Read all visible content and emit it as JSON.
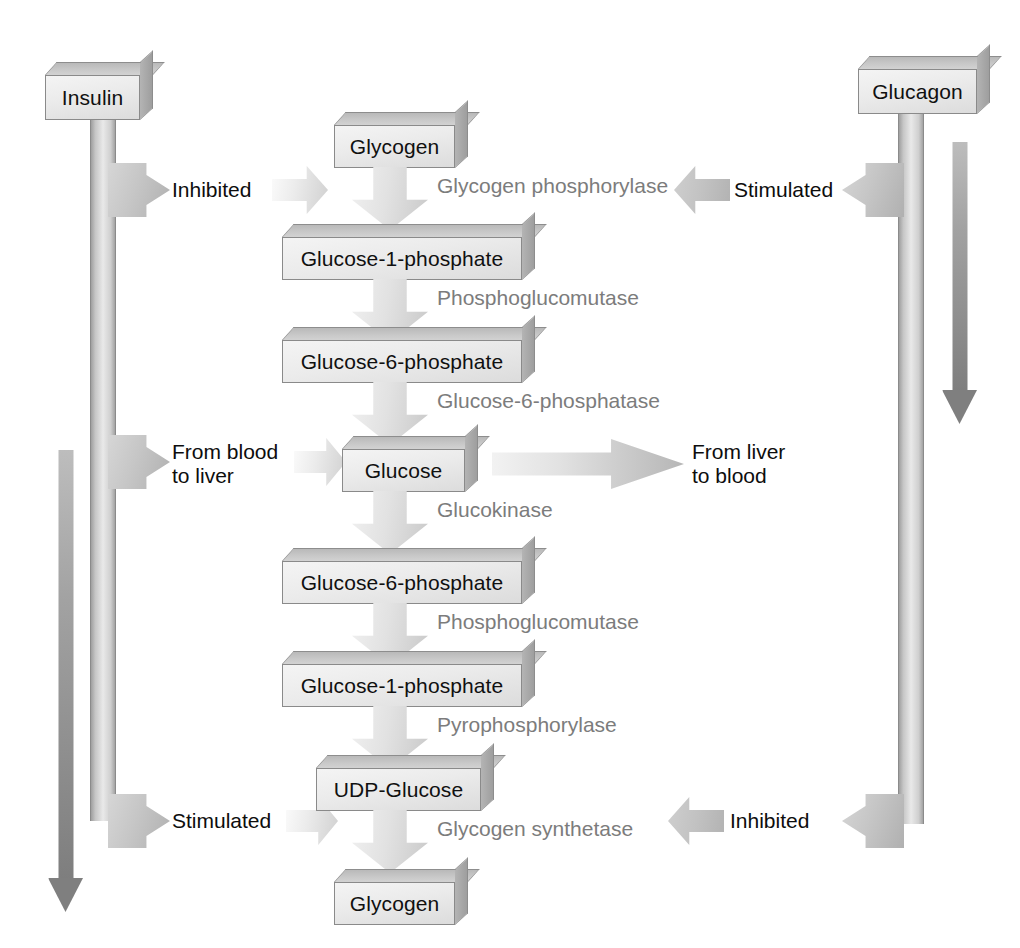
{
  "diagram": {
    "type": "flow-diagram",
    "colors": {
      "metabolite_text": "#0d0d0d",
      "enzyme_text": "#7c7c7c",
      "box_face": "#ececec",
      "box_edge": "#8a8a8a",
      "arrow_fill": "#c6c6c6",
      "background": "#ffffff"
    }
  },
  "hormones": {
    "left": {
      "label": "Insulin",
      "effects": [
        {
          "label": "Inhibited",
          "target": "Glycogen phosphorylase"
        },
        {
          "label": "From blood\nto liver",
          "target": "Glucose"
        },
        {
          "label": "Stimulated",
          "target": "Glycogen synthetase"
        }
      ]
    },
    "right": {
      "label": "Glucagon",
      "effects": [
        {
          "label": "Stimulated",
          "target": "Glycogen phosphorylase"
        },
        {
          "label": "Inhibited",
          "target": "Glycogen synthetase"
        }
      ]
    }
  },
  "transport": {
    "into_liver": "From blood\nto liver",
    "out_of_liver": "From liver\nto blood"
  },
  "metabolites": [
    {
      "id": "m0",
      "label": "Glycogen"
    },
    {
      "id": "m1",
      "label": "Glucose-1-phosphate"
    },
    {
      "id": "m2",
      "label": "Glucose-6-phosphate"
    },
    {
      "id": "m3",
      "label": "Glucose"
    },
    {
      "id": "m4",
      "label": "Glucose-6-phosphate"
    },
    {
      "id": "m5",
      "label": "Glucose-1-phosphate"
    },
    {
      "id": "m6",
      "label": "UDP-Glucose"
    },
    {
      "id": "m7",
      "label": "Glycogen"
    }
  ],
  "enzymes": [
    {
      "id": "e0",
      "label": "Glycogen phosphorylase",
      "from": "m0",
      "to": "m1"
    },
    {
      "id": "e1",
      "label": "Phosphoglucomutase",
      "from": "m1",
      "to": "m2"
    },
    {
      "id": "e2",
      "label": "Glucose-6-phosphatase",
      "from": "m2",
      "to": "m3"
    },
    {
      "id": "e3",
      "label": "Glucokinase",
      "from": "m3",
      "to": "m4"
    },
    {
      "id": "e4",
      "label": "Phosphoglucomutase",
      "from": "m4",
      "to": "m5"
    },
    {
      "id": "e5",
      "label": "Pyrophosphorylase",
      "from": "m5",
      "to": "m6"
    },
    {
      "id": "e6",
      "label": "Glycogen synthetase",
      "from": "m6",
      "to": "m7"
    }
  ]
}
